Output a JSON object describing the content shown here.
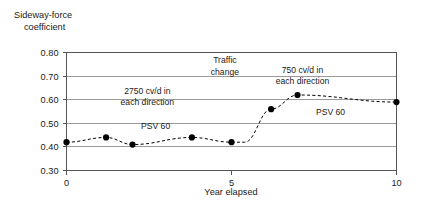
{
  "chart_data": {
    "type": "line",
    "title": "",
    "subtitle": "",
    "xlabel": "Year elapsed",
    "ylabel": "Sideway-force coefficient",
    "xlim": [
      0,
      10
    ],
    "ylim": [
      0.3,
      0.8
    ],
    "grid": true,
    "grid_axis": "y",
    "legend_position": "none",
    "x_ticks": [
      0,
      5,
      10
    ],
    "x_tick_labels": [
      "0",
      "5",
      "10"
    ],
    "y_ticks": [
      0.3,
      0.4,
      0.5,
      0.6,
      0.7,
      0.8
    ],
    "y_tick_labels": [
      "0.30",
      "0.40",
      "0.50",
      "0.60",
      "0.70",
      "0.80"
    ],
    "series": [
      {
        "name": "Sideway-force coefficient",
        "marker": "filled-circle",
        "line_style": "dashed",
        "color": "#000000",
        "x": [
          0,
          1.2,
          2,
          3.8,
          5,
          5.4,
          6.2,
          7,
          10
        ],
        "y": [
          0.42,
          0.44,
          0.41,
          0.44,
          0.42,
          0.42,
          0.56,
          0.62,
          0.59
        ],
        "points_visible": [
          true,
          true,
          true,
          true,
          true,
          false,
          true,
          true,
          true
        ]
      }
    ],
    "annotations": [
      {
        "id": "traffic-change",
        "lines": [
          "Traffic",
          "change"
        ],
        "x": 4.8,
        "y": 0.755,
        "align": "center"
      },
      {
        "id": "left-traffic-volume",
        "lines": [
          "2750 cv/d in",
          "each direction"
        ],
        "x": 2.45,
        "y": 0.625,
        "align": "center"
      },
      {
        "id": "right-traffic-volume",
        "lines": [
          "750 cv/d in",
          "each direction"
        ],
        "x": 7.15,
        "y": 0.715,
        "align": "center"
      },
      {
        "id": "psv-left",
        "lines": [
          "PSV 60"
        ],
        "x": 2.7,
        "y": 0.475,
        "align": "center"
      },
      {
        "id": "psv-right",
        "lines": [
          "PSV 60"
        ],
        "x": 8.0,
        "y": 0.535,
        "align": "center"
      }
    ]
  }
}
